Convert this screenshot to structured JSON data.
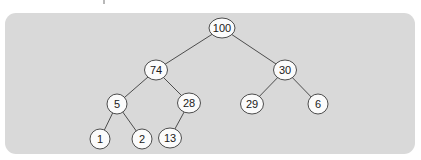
{
  "figure": {
    "colors": {
      "panel_bg": "#d9d9d9",
      "node_fill": "#fbfbfb",
      "line_stroke": "#4d4d4d",
      "text": "#202020",
      "page_bg": "#ffffff"
    },
    "tree": {
      "root": "100",
      "nodes": [
        {
          "id": "100",
          "label": "100",
          "x": 222,
          "y": 28
        },
        {
          "id": "74",
          "label": "74",
          "x": 156,
          "y": 70
        },
        {
          "id": "30",
          "label": "30",
          "x": 285,
          "y": 70
        },
        {
          "id": "5",
          "label": "5",
          "x": 117,
          "y": 104
        },
        {
          "id": "28",
          "label": "28",
          "x": 189,
          "y": 103
        },
        {
          "id": "29",
          "label": "29",
          "x": 252,
          "y": 104
        },
        {
          "id": "6",
          "label": "6",
          "x": 318,
          "y": 104
        },
        {
          "id": "1",
          "label": "1",
          "x": 100,
          "y": 139
        },
        {
          "id": "2",
          "label": "2",
          "x": 142,
          "y": 139
        },
        {
          "id": "13",
          "label": "13",
          "x": 170,
          "y": 138
        }
      ],
      "edges": [
        {
          "from": "100",
          "to": "74"
        },
        {
          "from": "100",
          "to": "30"
        },
        {
          "from": "74",
          "to": "5"
        },
        {
          "from": "74",
          "to": "28"
        },
        {
          "from": "30",
          "to": "29"
        },
        {
          "from": "30",
          "to": "6"
        },
        {
          "from": "5",
          "to": "1"
        },
        {
          "from": "5",
          "to": "2"
        },
        {
          "from": "28",
          "to": "13"
        }
      ]
    }
  }
}
